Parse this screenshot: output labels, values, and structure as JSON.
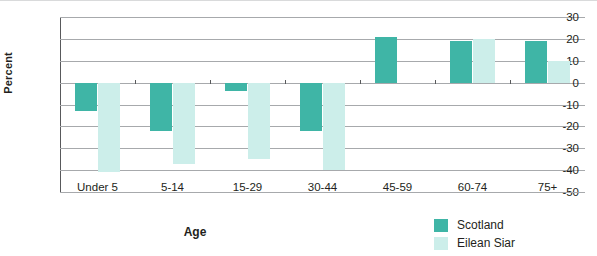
{
  "chart_data": {
    "type": "bar",
    "title": "",
    "xlabel": "Age",
    "ylabel": "Percent",
    "categories": [
      "Under 5",
      "5-14",
      "15-29",
      "30-44",
      "45-59",
      "60-74",
      "75+"
    ],
    "series": [
      {
        "name": "Scotland",
        "color": "#3fb5a6",
        "values": [
          -13,
          -22,
          -4,
          -22,
          21,
          19,
          19
        ]
      },
      {
        "name": "Eilean Siar",
        "color": "#cceeea",
        "values": [
          -41,
          -37,
          -35,
          -40,
          0,
          20,
          10
        ]
      }
    ],
    "ylim": [
      -50,
      30
    ],
    "yticks": [
      30,
      20,
      10,
      0,
      -10,
      -20,
      -30,
      -40,
      -50
    ],
    "ytick_labels": [
      "30",
      "20",
      "10",
      "0",
      "-10",
      "-20",
      "-30",
      "-40",
      "-50"
    ],
    "grid": true,
    "legend_position": "bottom-right"
  },
  "legend": {
    "items": [
      {
        "label": "Scotland",
        "color": "#3fb5a6"
      },
      {
        "label": "Eilean Siar",
        "color": "#cceeea"
      }
    ]
  }
}
